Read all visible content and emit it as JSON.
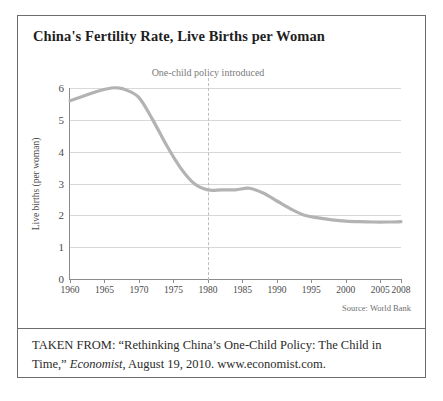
{
  "figure": {
    "title": "China's Fertility Rate, Live Births per Woman",
    "annotation": "One-child policy introduced",
    "source_note": "Source: World Bank",
    "caption": {
      "prefix": "TAKEN FROM: “Rethinking China’s One-Child Policy: The Child in Time,” ",
      "italic": "Economist",
      "suffix": ", August 19, 2010. www.economist.com."
    },
    "colors": {
      "line": "#b3b3b3",
      "grid": "#d8d8d8",
      "axis": "#8c8c8c",
      "border": "#6d6d6d",
      "annotation_line": "#bdbdbd",
      "text": "#2b2b2b"
    }
  },
  "chart_data": {
    "type": "line",
    "title": "China's Fertility Rate, Live Births per Woman",
    "xlabel": "",
    "ylabel": "Live births (per woman)",
    "xlim": [
      1960,
      2008
    ],
    "ylim": [
      0,
      6
    ],
    "grid": "horizontal",
    "legend": "none",
    "yticks": [
      0,
      1,
      2,
      3,
      4,
      5,
      6
    ],
    "xticks": [
      1960,
      1965,
      1970,
      1975,
      1980,
      1985,
      1990,
      1995,
      2000,
      2005,
      2008
    ],
    "xtick_labels": [
      "1960",
      "1965",
      "1970",
      "1975",
      "1980",
      "1985",
      "1990",
      "1995",
      "2000",
      "2005",
      "2008"
    ],
    "ytick_labels": [
      "0",
      "1",
      "2",
      "3",
      "4",
      "5",
      "6"
    ],
    "annotations": [
      {
        "text": "One-child policy introduced",
        "x": 1980,
        "style": "dashed vertical line with label above plot"
      }
    ],
    "series": [
      {
        "name": "Live births per woman",
        "color": "#b3b3b3",
        "x": [
          1960,
          1962,
          1964,
          1966,
          1967,
          1968,
          1970,
          1972,
          1974,
          1976,
          1978,
          1980,
          1982,
          1984,
          1986,
          1988,
          1990,
          1992,
          1994,
          1996,
          1998,
          2000,
          2002,
          2004,
          2006,
          2008
        ],
        "values": [
          5.6,
          5.75,
          5.9,
          6.0,
          6.0,
          5.95,
          5.7,
          5.0,
          4.2,
          3.5,
          3.0,
          2.8,
          2.8,
          2.8,
          2.85,
          2.7,
          2.45,
          2.2,
          2.0,
          1.92,
          1.86,
          1.82,
          1.8,
          1.79,
          1.79,
          1.8
        ]
      }
    ]
  }
}
